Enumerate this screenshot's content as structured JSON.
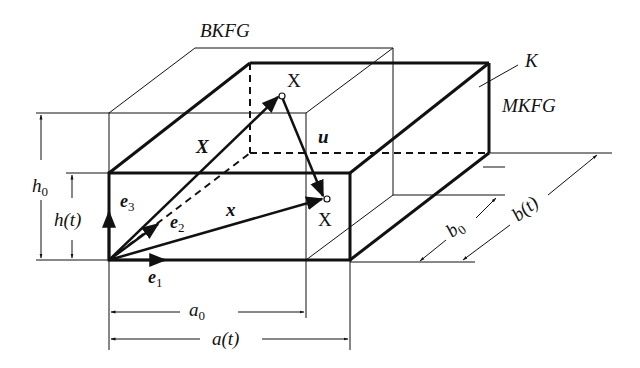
{
  "diagram": {
    "labels": {
      "reference_body": "BKFG",
      "current_body": "MKFG",
      "body": "K",
      "point_ref": "X",
      "point_cur": "X",
      "vec_X": "X",
      "vec_x": "x",
      "vec_u": "u",
      "e1": "e",
      "e1_sub": "1",
      "e2": "e",
      "e2_sub": "2",
      "e3": "e",
      "e3_sub": "3",
      "a0": "a",
      "a0_sub": "0",
      "at": "a(t)",
      "b0": "b",
      "b0_sub": "0",
      "bt": "b(t)",
      "h0": "h",
      "h0_sub": "0",
      "ht": "h(t)"
    },
    "colors": {
      "line": "#111111",
      "background": "#ffffff"
    }
  }
}
